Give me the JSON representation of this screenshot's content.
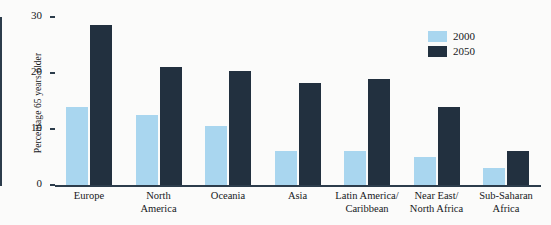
{
  "chart_data": {
    "type": "bar",
    "title": "",
    "xlabel": "",
    "ylabel": "Percentage 65 years older",
    "ylim": [
      0,
      30
    ],
    "yticks": [
      0,
      10,
      20,
      30
    ],
    "grid": false,
    "legend_position": "top-right",
    "categories": [
      "Europe",
      "North America",
      "Oceania",
      "Asia",
      "Latin America/ Caribbean",
      "Near East/ North Africa",
      "Sub-Saharan Africa"
    ],
    "category_lines": [
      [
        "Europe"
      ],
      [
        "North",
        "America"
      ],
      [
        "Oceania"
      ],
      [
        "Asia"
      ],
      [
        "Latin America/",
        "Caribbean"
      ],
      [
        "Near East/",
        "North Africa"
      ],
      [
        "Sub-Saharan",
        "Africa"
      ]
    ],
    "series": [
      {
        "name": "2000",
        "color": "#a9d6ef",
        "values": [
          14,
          12.5,
          10.5,
          6,
          6,
          5,
          3
        ]
      },
      {
        "name": "2050",
        "color": "#22303f",
        "values": [
          28.5,
          21,
          20.3,
          18.3,
          19,
          14,
          6
        ]
      }
    ]
  },
  "legend": {
    "items": [
      {
        "label": "2000",
        "swatch": "light"
      },
      {
        "label": "2050",
        "swatch": "dark"
      }
    ]
  },
  "axis": {
    "y_labels": [
      "30",
      "20",
      "10",
      "0"
    ],
    "y_title": "Percentage 65 years older"
  },
  "colors": {
    "series_2000": "#a9d6ef",
    "series_2050": "#22303f",
    "axis": "#2c3c4b",
    "background": "#fbfbfa",
    "text": "#16181a"
  }
}
